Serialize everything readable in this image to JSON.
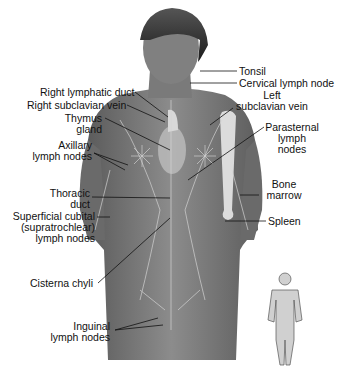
{
  "figure": {
    "labels": {
      "right_lymphatic_duct": "Right lymphatic duct",
      "right_subclavian_vein": "Right subclavian vein",
      "thymus_line1": "Thymus",
      "thymus_line2": "gland",
      "axillary_line1": "Axillary",
      "axillary_line2": "lymph nodes",
      "thoracic_line1": "Thoracic",
      "thoracic_line2": "duct",
      "superficial_line1": "Superficial cubital",
      "superficial_line2": "(supratrochlear)",
      "superficial_line3": "lymph nodes",
      "cisterna_chyli": "Cisterna chyli",
      "inguinal_line1": "Inguinal",
      "inguinal_line2": "lymph nodes",
      "tonsil": "Tonsil",
      "cervical_lymph_node": "Cervical lymph node",
      "left_subclavian_line1": "Left",
      "left_subclavian_line2": "subclavian vein",
      "parasternal_line1": "Parasternal",
      "parasternal_line2": "lymph",
      "parasternal_line3": "nodes",
      "bone_marrow_line1": "Bone",
      "bone_marrow_line2": "marrow",
      "spleen": "Spleen"
    },
    "inset": "full-body-thumbnail"
  }
}
